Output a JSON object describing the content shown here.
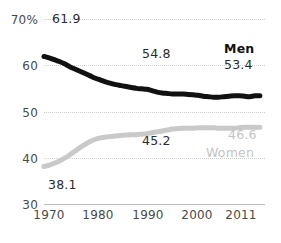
{
  "chart_data": {
    "type": "line",
    "title": "",
    "subtitle": "",
    "xlabel": "",
    "ylabel": "",
    "ylim": [
      30,
      70
    ],
    "xlim": [
      1970,
      2013
    ],
    "grid": true,
    "legend_position": "inline-right",
    "y_ticks": [
      {
        "value": 70,
        "label": "70%"
      },
      {
        "value": 60,
        "label": "60"
      },
      {
        "value": 50,
        "label": "50"
      },
      {
        "value": 40,
        "label": "40"
      },
      {
        "value": 30,
        "label": "30"
      }
    ],
    "x_ticks": [
      {
        "value": 1970,
        "label": "1970"
      },
      {
        "value": 1980,
        "label": "1980"
      },
      {
        "value": 1990,
        "label": "1990"
      },
      {
        "value": 2000,
        "label": "2000"
      },
      {
        "value": 2011,
        "label": "2011"
      }
    ],
    "x": [
      1970,
      1971,
      1972,
      1973,
      1974,
      1975,
      1976,
      1977,
      1978,
      1979,
      1980,
      1981,
      1982,
      1983,
      1984,
      1985,
      1986,
      1987,
      1988,
      1989,
      1990,
      1991,
      1992,
      1993,
      1994,
      1995,
      1996,
      1997,
      1998,
      1999,
      2000,
      2001,
      2002,
      2003,
      2004,
      2005,
      2006,
      2007,
      2008,
      2009,
      2010,
      2011,
      2012
    ],
    "series": [
      {
        "name": "Men",
        "color": "#111111",
        "values": [
          61.9,
          61.6,
          61.2,
          60.8,
          60.3,
          59.7,
          59.2,
          58.7,
          58.2,
          57.7,
          57.2,
          56.8,
          56.4,
          56.1,
          55.8,
          55.6,
          55.4,
          55.2,
          55.0,
          54.9,
          54.8,
          54.5,
          54.2,
          54.0,
          53.9,
          53.8,
          53.8,
          53.8,
          53.7,
          53.6,
          53.5,
          53.3,
          53.2,
          53.1,
          53.1,
          53.2,
          53.3,
          53.4,
          53.4,
          53.3,
          53.2,
          53.4,
          53.4
        ],
        "start_label": "61.9",
        "mid_label": "54.8",
        "end_label": "53.4",
        "series_label": "Men",
        "series_label_bold": true
      },
      {
        "name": "Women",
        "color": "#c9c9c9",
        "values": [
          38.1,
          38.4,
          38.8,
          39.3,
          39.9,
          40.6,
          41.4,
          42.2,
          42.9,
          43.5,
          44.0,
          44.3,
          44.5,
          44.6,
          44.7,
          44.8,
          44.9,
          45.0,
          45.0,
          45.1,
          45.2,
          45.4,
          45.6,
          45.8,
          46.0,
          46.2,
          46.3,
          46.4,
          46.4,
          46.4,
          46.5,
          46.5,
          46.5,
          46.5,
          46.4,
          46.4,
          46.4,
          46.4,
          46.5,
          46.6,
          46.6,
          46.6,
          46.6
        ],
        "start_label": "38.1",
        "mid_label": "45.2",
        "end_label": "46.6",
        "series_label": "Women",
        "series_label_bold": false
      }
    ],
    "annotations": [
      {
        "text": "61.9",
        "series": "Men",
        "x": 1970,
        "y": 61.9
      },
      {
        "text": "54.8",
        "series": "Men",
        "x": 1990,
        "y": 54.8
      },
      {
        "text": "53.4",
        "series": "Men",
        "x": 2011,
        "y": 53.4
      },
      {
        "text": "Men",
        "series": "Men",
        "x": 2011,
        "y": 53.4
      },
      {
        "text": "38.1",
        "series": "Women",
        "x": 1970,
        "y": 38.1
      },
      {
        "text": "45.2",
        "series": "Women",
        "x": 1990,
        "y": 45.2
      },
      {
        "text": "46.6",
        "series": "Women",
        "x": 2011,
        "y": 46.6
      },
      {
        "text": "Women",
        "series": "Women",
        "x": 2011,
        "y": 46.6
      }
    ]
  }
}
